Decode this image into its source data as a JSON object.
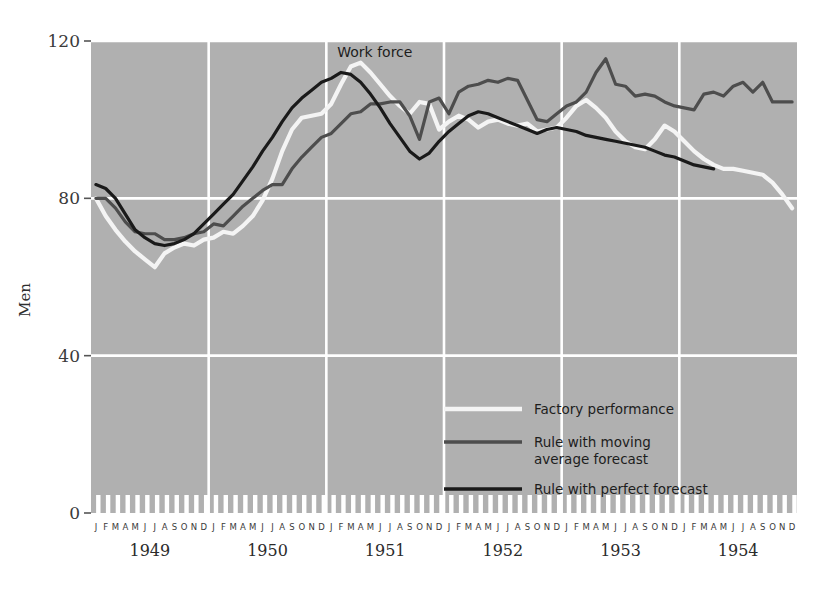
{
  "page": {
    "top_text_fragment": "          p                                      p                              p"
  },
  "chart_data": {
    "type": "line",
    "title": "",
    "xlabel": "",
    "ylabel": "Men",
    "ylim": [
      0,
      120
    ],
    "yticks": [
      0,
      40,
      80,
      120
    ],
    "ytick_labels": [
      "0",
      "40",
      "80",
      "120"
    ],
    "grid": true,
    "gridlines_y": [
      40,
      80,
      120
    ],
    "legend_position": "inside-lower-right",
    "annotations": [
      {
        "text": "Work force",
        "x": "1951-01",
        "y": 116
      }
    ],
    "years": [
      "1949",
      "1950",
      "1951",
      "1952",
      "1953",
      "1954"
    ],
    "month_letters": [
      "J",
      "F",
      "M",
      "A",
      "M",
      "J",
      "J",
      "A",
      "S",
      "O",
      "N",
      "D"
    ],
    "x_start": "1949-01",
    "x_end": "1954-12",
    "series": [
      {
        "name": "Factory performance",
        "color": "#f4f4f4",
        "width": 4.2,
        "values": [
          80.0,
          75.5,
          72.0,
          69.0,
          66.5,
          64.5,
          62.5,
          66.0,
          67.5,
          68.5,
          68.0,
          69.5,
          70.0,
          71.5,
          71.0,
          73.0,
          75.5,
          79.5,
          85.0,
          92.0,
          97.5,
          100.5,
          101.0,
          101.5,
          104.0,
          109.0,
          113.5,
          114.5,
          112.0,
          109.0,
          106.0,
          103.5,
          101.5,
          104.5,
          104.0,
          97.5,
          99.5,
          101.0,
          100.0,
          98.0,
          99.5,
          100.0,
          99.0,
          98.5,
          99.0,
          97.0,
          97.5,
          98.0,
          100.5,
          103.5,
          105.0,
          103.0,
          100.5,
          97.0,
          94.5,
          93.0,
          92.5,
          95.0,
          98.5,
          97.0,
          94.5,
          92.0,
          90.0,
          88.5,
          87.5,
          87.5,
          87.0,
          86.5,
          86.0,
          84.0,
          81.0,
          77.5
        ]
      },
      {
        "name": "Rule with moving average forecast",
        "color": "#4d4d4d",
        "width": 3.2,
        "values": [
          80.0,
          80.0,
          77.5,
          74.0,
          71.5,
          71.0,
          71.0,
          69.5,
          69.5,
          70.0,
          71.0,
          71.5,
          73.5,
          73.0,
          75.5,
          78.0,
          80.0,
          82.0,
          83.5,
          83.5,
          87.5,
          90.5,
          93.0,
          95.5,
          96.5,
          99.0,
          101.5,
          102.0,
          104.0,
          104.0,
          104.5,
          104.5,
          101.0,
          95.0,
          104.5,
          105.5,
          101.5,
          107.0,
          108.5,
          109.0,
          110.0,
          109.5,
          110.5,
          110.0,
          105.0,
          100.0,
          99.5,
          101.5,
          103.5,
          104.5,
          107.0,
          112.0,
          115.5,
          109.0,
          108.5,
          106.0,
          106.5,
          106.0,
          104.5,
          103.5,
          103.0,
          102.5,
          106.5,
          107.0,
          106.0,
          108.5,
          109.5,
          107.0,
          109.5,
          104.5,
          104.5,
          104.5
        ]
      },
      {
        "name": "Rule with perfect forecast",
        "color": "#1a1a1a",
        "width": 3.2,
        "values": [
          83.5,
          82.5,
          80.0,
          76.0,
          72.0,
          70.0,
          68.5,
          68.0,
          68.5,
          69.5,
          71.0,
          73.5,
          76.0,
          78.5,
          81.0,
          84.5,
          88.0,
          92.0,
          95.5,
          99.5,
          103.0,
          105.5,
          107.5,
          109.5,
          110.5,
          112.0,
          111.5,
          109.5,
          106.5,
          103.0,
          99.0,
          95.5,
          92.0,
          90.0,
          91.5,
          94.5,
          97.0,
          99.0,
          101.0,
          102.0,
          101.5,
          100.5,
          99.5,
          98.5,
          97.5,
          96.5,
          97.5,
          98.0,
          97.5,
          97.0,
          96.0,
          95.5,
          95.0,
          94.5,
          94.0,
          93.5,
          93.0,
          92.0,
          91.0,
          90.5,
          89.5,
          88.5,
          88.0,
          87.5,
          null,
          null,
          null,
          null,
          null,
          null,
          null,
          null
        ]
      }
    ]
  },
  "legend": {
    "items": [
      {
        "label": "Factory performance",
        "color": "#f4f4f4"
      },
      {
        "label": "Rule with moving",
        "label2": "average forecast",
        "color": "#4d4d4d"
      },
      {
        "label": "Rule with perfect forecast",
        "color": "#1a1a1a"
      }
    ]
  },
  "colors": {
    "plot_background": "#b0b0b0",
    "grid": "#ffffff",
    "page_background": "#ffffff",
    "tick_band": "#ffffff"
  }
}
